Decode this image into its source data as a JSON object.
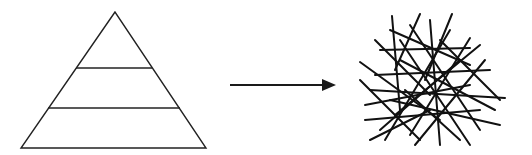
{
  "diagram": {
    "left_shape": {
      "type": "pyramid",
      "levels": 3
    },
    "connector": {
      "type": "arrow",
      "direction": "right"
    },
    "right_shape": {
      "type": "tangled-lines"
    }
  },
  "colors": {
    "stroke": "#1a1a1a",
    "background": "#ffffff"
  }
}
